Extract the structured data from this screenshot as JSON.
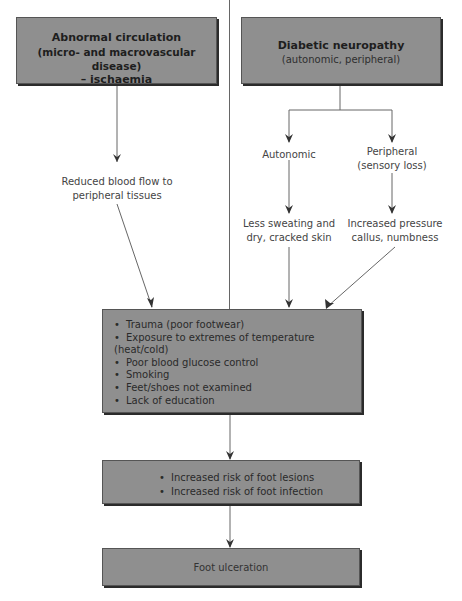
{
  "diagram": {
    "top_left_box": {
      "title_lines": [
        "Abnormal circulation",
        "(micro- and macrovascular disease)",
        "– ischaemia"
      ]
    },
    "top_right_box": {
      "title": "Diabetic neuropathy",
      "subtitle": "(autonomic, peripheral)"
    },
    "branches": {
      "autonomic": "Autonomic",
      "peripheral_lines": [
        "Peripheral",
        "(sensory loss)"
      ]
    },
    "effects": {
      "reduced_blood_flow_lines": [
        "Reduced blood flow to",
        "peripheral tissues"
      ],
      "less_sweating_lines": [
        "Less sweating and",
        "dry, cracked skin"
      ],
      "increased_pressure_lines": [
        "Increased pressure",
        "callus, numbness"
      ]
    },
    "risk_factors_box": {
      "items": [
        "Trauma (poor footwear)",
        "Exposure to extremes of temperature (heat/cold)",
        "Poor blood glucose control",
        "Smoking",
        "Feet/shoes not examined",
        "Lack of education"
      ]
    },
    "risk_box": {
      "items": [
        "Increased risk of foot lesions",
        "Increased risk of foot infection"
      ]
    },
    "outcome_box": {
      "label": "Foot ulceration"
    },
    "colors": {
      "box_fill": "#8f8f8f",
      "box_shadow": "#2b2b2b",
      "line": "#555555",
      "text": "#3a3a3a"
    }
  }
}
